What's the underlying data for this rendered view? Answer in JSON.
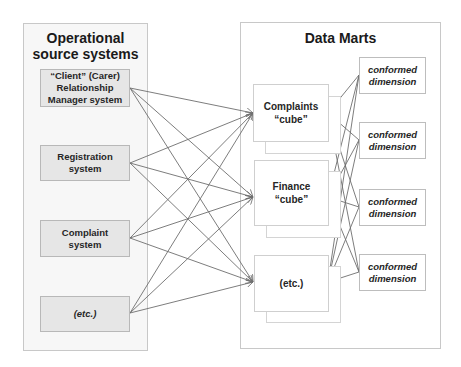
{
  "diagram": {
    "left_panel": {
      "title": "Operational source systems",
      "title_line1": "Operational",
      "title_line2": "source systems",
      "systems": [
        {
          "line1": "“Client” (Carer)",
          "line2": "Relationship",
          "line3": "Manager system",
          "italic": false
        },
        {
          "line1": "Registration",
          "line2": "system",
          "italic": false
        },
        {
          "line1": "Complaint",
          "line2": "system",
          "italic": false
        },
        {
          "line1": "(etc.)",
          "italic": true
        }
      ]
    },
    "right_panel": {
      "title": "Data Marts",
      "cubes": [
        {
          "line1": "Complaints",
          "line2": "“cube”"
        },
        {
          "line1": "Finance",
          "line2": "“cube”"
        },
        {
          "line1": "(etc.)"
        }
      ],
      "dimensions": [
        {
          "line1": "conformed",
          "line2": "dimension"
        },
        {
          "line1": "conformed",
          "line2": "dimension"
        },
        {
          "line1": "conformed",
          "line2": "dimension"
        },
        {
          "line1": "conformed",
          "line2": "dimension"
        }
      ]
    },
    "connections": {
      "source_to_cube": "every source system connects to every cube (arrows into cubes)",
      "cube_to_dimension": "every cube connects to every conformed dimension"
    },
    "colors": {
      "line": "#6e6e6e",
      "source_fill": "#e6e6e6",
      "panel_left_fill": "#f7f7f7",
      "panel_border": "#c8c8c8"
    }
  }
}
